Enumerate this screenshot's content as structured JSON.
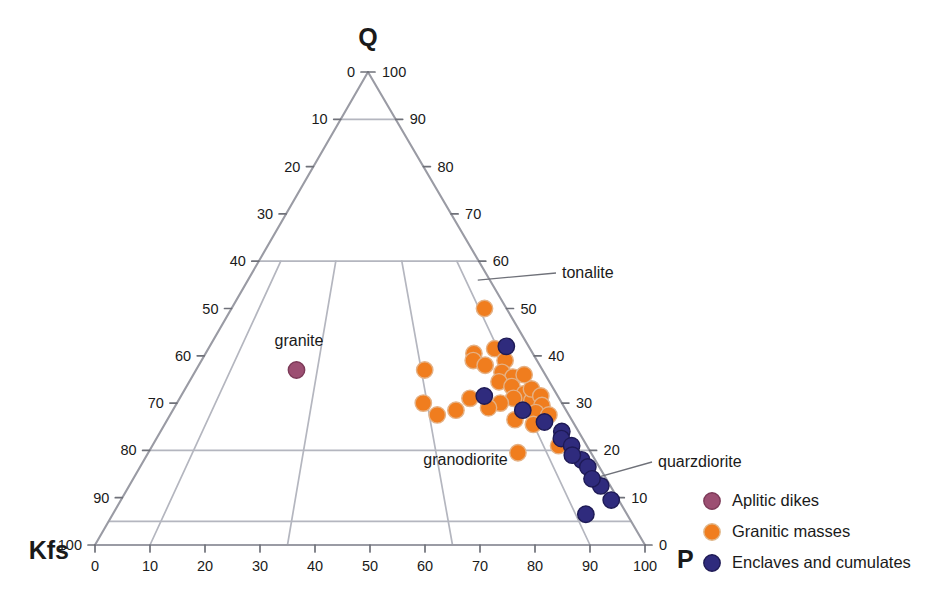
{
  "chart_data": {
    "type": "scatter",
    "subtype": "ternary-QAP",
    "title": "",
    "apexes": {
      "top": "Q",
      "left": "Kfs",
      "right": "P"
    },
    "axes": {
      "left": {
        "name": "Kfs",
        "description": "left edge, Q-apex to Kfs corner",
        "ticks": [
          0,
          10,
          20,
          30,
          40,
          50,
          60,
          70,
          80,
          90,
          100
        ]
      },
      "right": {
        "name": "Q",
        "description": "right edge, Q-apex to P corner",
        "ticks": [
          100,
          90,
          80,
          70,
          60,
          50,
          40,
          30,
          20,
          10,
          0
        ]
      },
      "bottom": {
        "name": "P",
        "description": "bottom edge, Kfs corner to P corner",
        "ticks": [
          0,
          10,
          20,
          30,
          40,
          50,
          60,
          70,
          80,
          90,
          100
        ]
      }
    },
    "grid": {
      "horizontal_q_levels": [
        90,
        60,
        20,
        5
      ],
      "radial_p_ratios": [
        10,
        35,
        65,
        90
      ]
    },
    "field_labels": [
      {
        "text": "granite",
        "q": 42,
        "pratio": 28
      },
      {
        "text": "granodiorite",
        "q": 17,
        "pratio": 71
      }
    ],
    "callouts": [
      {
        "text": "tonalite",
        "q": 56,
        "pratio": 95
      },
      {
        "text": "quarzdiorite",
        "q": 14,
        "pratio": 97
      }
    ],
    "legend": {
      "position": "bottom-right",
      "items": [
        {
          "label": "Aplitic dikes",
          "color": "#9c4f72",
          "edge": "#7c3a58"
        },
        {
          "label": "Granitic masses",
          "color": "#f07d1e",
          "edge": "#e0b78a"
        },
        {
          "label": "Enclaves and cumulates",
          "color": "#2f2b7d",
          "edge": "#1e1a55"
        }
      ]
    },
    "series": [
      {
        "name": "Aplitic dikes",
        "color": "#9c4f72",
        "edge": "#7c3a58",
        "points": [
          {
            "q": 37,
            "pratio": 29
          }
        ]
      },
      {
        "name": "Granitic masses",
        "color": "#f07d1e",
        "edge": "#e5b184",
        "points": [
          {
            "q": 50.0,
            "pratio": 92.0
          },
          {
            "q": 37.0,
            "pratio": 66.0
          },
          {
            "q": 40.5,
            "pratio": 82.0
          },
          {
            "q": 39.0,
            "pratio": 81.0
          },
          {
            "q": 38.0,
            "pratio": 84.0
          },
          {
            "q": 41.5,
            "pratio": 89.0
          },
          {
            "q": 39.0,
            "pratio": 90.5
          },
          {
            "q": 36.5,
            "pratio": 88.0
          },
          {
            "q": 35.5,
            "pratio": 90.5
          },
          {
            "q": 34.5,
            "pratio": 86.0
          },
          {
            "q": 33.5,
            "pratio": 89.0
          },
          {
            "q": 32.0,
            "pratio": 91.5
          },
          {
            "q": 31.0,
            "pratio": 88.0
          },
          {
            "q": 30.5,
            "pratio": 92.5
          },
          {
            "q": 33.0,
            "pratio": 94.0
          },
          {
            "q": 31.5,
            "pratio": 95.5
          },
          {
            "q": 29.5,
            "pratio": 94.5
          },
          {
            "q": 28.0,
            "pratio": 92.0
          },
          {
            "q": 27.5,
            "pratio": 95.0
          },
          {
            "q": 30.0,
            "pratio": 84.0
          },
          {
            "q": 29.0,
            "pratio": 80.5
          },
          {
            "q": 31.0,
            "pratio": 76.5
          },
          {
            "q": 28.5,
            "pratio": 72.0
          },
          {
            "q": 27.5,
            "pratio": 67.0
          },
          {
            "q": 30.0,
            "pratio": 64.0
          },
          {
            "q": 26.5,
            "pratio": 86.0
          },
          {
            "q": 25.5,
            "pratio": 90.0
          },
          {
            "q": 21.0,
            "pratio": 93.5
          },
          {
            "q": 19.5,
            "pratio": 83.5
          },
          {
            "q": 36.0,
            "pratio": 94.0
          }
        ]
      },
      {
        "name": "Enclaves and cumulates",
        "color": "#2f2b7d",
        "edge": "#1e1a55",
        "points": [
          {
            "q": 42.0,
            "pratio": 93.0
          },
          {
            "q": 31.5,
            "pratio": 80.5
          },
          {
            "q": 28.5,
            "pratio": 89.0
          },
          {
            "q": 24.0,
            "pratio": 96.0
          },
          {
            "q": 22.5,
            "pratio": 95.0
          },
          {
            "q": 21.0,
            "pratio": 96.5
          },
          {
            "q": 18.0,
            "pratio": 97.0
          },
          {
            "q": 16.5,
            "pratio": 97.5
          },
          {
            "q": 12.5,
            "pratio": 98.0
          },
          {
            "q": 9.5,
            "pratio": 98.5
          },
          {
            "q": 6.5,
            "pratio": 92.0
          },
          {
            "q": 26.0,
            "pratio": 93.0
          },
          {
            "q": 19.0,
            "pratio": 95.5
          },
          {
            "q": 14.0,
            "pratio": 97.0
          }
        ]
      }
    ]
  }
}
